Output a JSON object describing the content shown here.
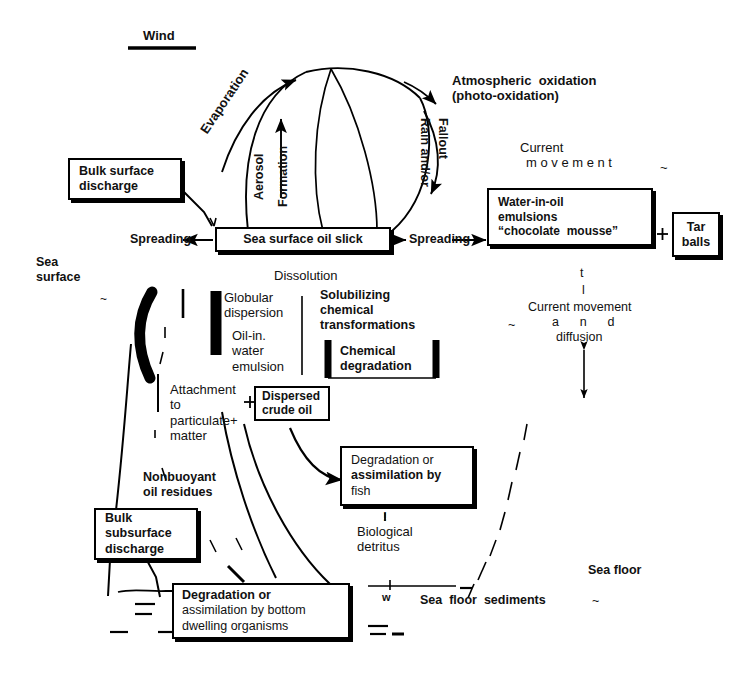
{
  "diagram": {
    "colors": {
      "ink": "#111111",
      "line": "#000000",
      "background": "#ffffff"
    }
  },
  "labels": {
    "wind": "Wind",
    "evaporation": "Evaporation",
    "aerosol": "Aerosol",
    "formation": "Formation",
    "rain_and_or": "Rain and/or",
    "fallout": "Fallout",
    "atmospheric_oxidation_1": "Atmospheric  oxidation",
    "atmospheric_oxidation_2": "(photo-oxidation)",
    "current_movement_1": "Current",
    "current_movement_2": "m o v e m e n t",
    "sea": "Sea",
    "surface": "surface",
    "spreading_left": "Spreading",
    "spreading_right": "Spreading",
    "dissolution": "Dissolution",
    "globular": "Globular",
    "dispersion": "dispersion",
    "oil_in": "Oil-in.",
    "water": "water",
    "emulsion": "emulsion",
    "solubilizing": "Solubilizing",
    "chemical": "chemical",
    "transformations": "transformations",
    "attachment": "Attachment",
    "to": "to",
    "particulate": "particulate+",
    "matter": "matter",
    "nonbuoyant": "Nonbuoyant",
    "oil_residues": "oil residues",
    "biological": "Biological",
    "detritus": "detritus",
    "current_movement_and_1": "t",
    "current_movement_and_2": "l",
    "current_movement_and_3": "Current movement",
    "current_movement_and_4": "a      n      d",
    "current_movement_and_5": "diffusion",
    "tilde_left": "~",
    "tilde_right": "~",
    "tilde_current": "~",
    "sea_floor": "Sea floor",
    "sea_floor_sediments": "Sea  floor  sediments",
    "sea_floor_sediments_tilde": "~",
    "w_mark": "w",
    "plus_tar": "+",
    "exclaim_detritus": "!"
  },
  "boxes": {
    "bulk_surface_discharge": {
      "line1": "Bulk surface",
      "line2": "discharge"
    },
    "sea_surface_oil_slick": {
      "label": "Sea surface oil slick"
    },
    "water_in_oil": {
      "line1": "Water-in-oil",
      "line2": "emulsions",
      "line3": "“chocolate  mousse”"
    },
    "tar_balls": {
      "line1": "Tar",
      "line2": "balls"
    },
    "chemical_degradation": {
      "line1": "Chemical",
      "line2": "degradation"
    },
    "dispersed_crude_oil": {
      "line1": "Dispersed",
      "line2": "crude oil"
    },
    "degradation_fish": {
      "line1": "Degradation or",
      "line2": "assimilation by",
      "line3": "fish"
    },
    "bulk_subsurface_discharge": {
      "line1": "Bulk",
      "line2": "subsurface",
      "line3": "discharge"
    },
    "degradation_bottom": {
      "line1": "Degradation or",
      "line2": "assimilation by bottom",
      "line3": "dwelling organisms"
    }
  }
}
